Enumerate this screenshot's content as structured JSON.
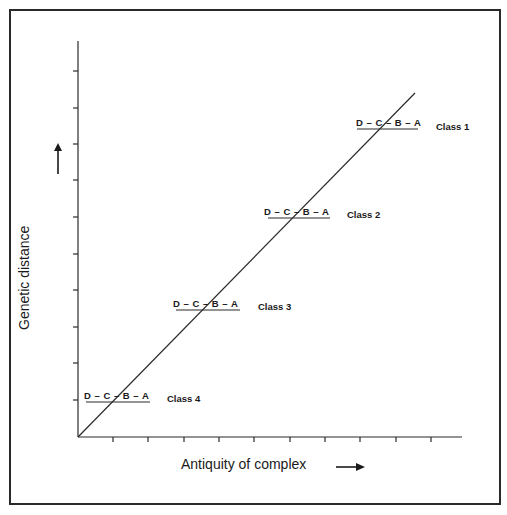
{
  "diagram": {
    "x_axis_label": "Antiquity of complex",
    "y_axis_label": "Genetic distance",
    "x_arrow_icon": "right-arrow",
    "y_arrow_icon": "up-arrow",
    "classes": [
      {
        "sequence": "D – C – B – A",
        "label": "Class 1"
      },
      {
        "sequence": "D – C – B – A",
        "label": "Class 2"
      },
      {
        "sequence": "D – C – B – A",
        "label": "Class 3"
      },
      {
        "sequence": "D – C – B – A",
        "label": "Class 4"
      }
    ],
    "y_tick_count": 10,
    "x_tick_count": 10,
    "line_color": "#2a2a2a"
  }
}
